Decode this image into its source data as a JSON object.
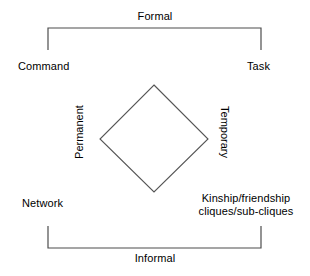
{
  "diagram": {
    "title_top": "Formal",
    "title_bottom": "Informal",
    "corners": {
      "top_left": "Command",
      "top_right": "Task",
      "bottom_left": "Network",
      "bottom_right_line1": "Kinship/friendship",
      "bottom_right_line2": "cliques/sub-cliques"
    },
    "axis_left": "Permanent",
    "axis_right": "Temporary",
    "colors": {
      "background": "#ffffff",
      "stroke": "#4d4d4d",
      "diamond_stroke": "#555555",
      "text": "#000000"
    }
  }
}
